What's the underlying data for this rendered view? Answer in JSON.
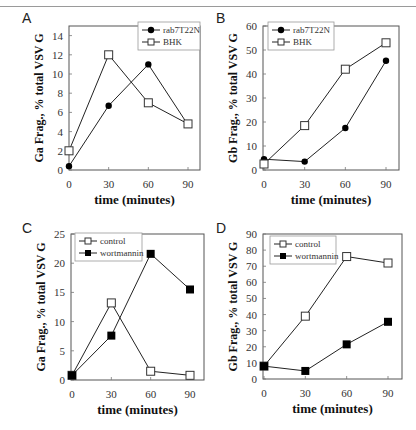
{
  "figure": {
    "panels": [
      {
        "letter": "A"
      },
      {
        "letter": "B"
      },
      {
        "letter": "C"
      },
      {
        "letter": "D"
      }
    ]
  },
  "chart_data": [
    {
      "panel": "A",
      "type": "line",
      "title": "",
      "xlabel": "time (minutes)",
      "ylabel": "Ga Frag., % total VSV G",
      "x": [
        0,
        30,
        60,
        90
      ],
      "xticks": [
        0,
        30,
        60,
        90
      ],
      "yticks": [
        0,
        2,
        4,
        6,
        8,
        10,
        12,
        14
      ],
      "ylim": [
        0,
        15
      ],
      "legend_position": "upper right",
      "series": [
        {
          "name": "rab7T22N",
          "marker": "filled-circle",
          "values": [
            0.4,
            6.7,
            11.0,
            4.7
          ]
        },
        {
          "name": "BHK",
          "marker": "open-square",
          "values": [
            2.0,
            12.0,
            7.0,
            4.8
          ]
        }
      ]
    },
    {
      "panel": "B",
      "type": "line",
      "title": "",
      "xlabel": "time (minutes)",
      "ylabel": "Gb Frag., % total VSV G",
      "x": [
        0,
        30,
        60,
        90
      ],
      "xticks": [
        0,
        30,
        60,
        90
      ],
      "yticks": [
        0,
        10,
        20,
        30,
        40,
        50,
        60
      ],
      "ylim": [
        0,
        60
      ],
      "legend_position": "upper left",
      "series": [
        {
          "name": "rab7T22N",
          "marker": "filled-circle",
          "values": [
            4.5,
            3.5,
            17.5,
            45.5
          ]
        },
        {
          "name": "BHK",
          "marker": "open-square",
          "values": [
            2.5,
            18.5,
            42.0,
            53.0
          ]
        }
      ]
    },
    {
      "panel": "C",
      "type": "line",
      "title": "",
      "xlabel": "time (minutes)",
      "ylabel": "Ga Frag., % total VSV G",
      "x": [
        0,
        30,
        60,
        90
      ],
      "xticks": [
        0,
        30,
        60,
        90
      ],
      "yticks": [
        0,
        5,
        10,
        15,
        20,
        25
      ],
      "ylim": [
        0,
        25
      ],
      "legend_position": "upper left",
      "series": [
        {
          "name": "control",
          "marker": "open-square",
          "values": [
            0.8,
            13.2,
            1.5,
            0.8
          ]
        },
        {
          "name": "wortmannin",
          "marker": "filled-square",
          "values": [
            0.8,
            7.6,
            21.6,
            15.5
          ]
        }
      ]
    },
    {
      "panel": "D",
      "type": "line",
      "title": "",
      "xlabel": "time (minutes)",
      "ylabel": "Gb Frag., % total VSV G",
      "x": [
        0,
        30,
        60,
        90
      ],
      "xticks": [
        0,
        30,
        60,
        90
      ],
      "yticks": [
        0,
        10,
        20,
        30,
        40,
        50,
        60,
        70,
        80,
        90
      ],
      "ylim": [
        0,
        90
      ],
      "legend_position": "upper left",
      "series": [
        {
          "name": "control",
          "marker": "open-square",
          "values": [
            8,
            39,
            76,
            72
          ]
        },
        {
          "name": "wortmannin",
          "marker": "filled-square",
          "values": [
            8,
            5,
            21.5,
            35.5
          ]
        }
      ]
    }
  ]
}
